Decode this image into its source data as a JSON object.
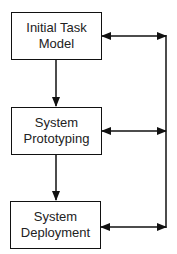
{
  "diagram": {
    "nodes": [
      {
        "id": "initial-task-model",
        "line1": "Initial Task",
        "line2": "Model"
      },
      {
        "id": "system-prototyping",
        "line1": "System",
        "line2": "Prototyping"
      },
      {
        "id": "system-deployment",
        "line1": "System",
        "line2": "Deployment"
      }
    ],
    "edges": [
      {
        "from": "initial-task-model",
        "to": "system-prototyping",
        "type": "directed"
      },
      {
        "from": "system-prototyping",
        "to": "system-deployment",
        "type": "directed"
      },
      {
        "from": "initial-task-model",
        "to": "feedback-bus",
        "type": "bidirectional"
      },
      {
        "from": "system-prototyping",
        "to": "feedback-bus",
        "type": "bidirectional"
      },
      {
        "from": "system-deployment",
        "to": "feedback-bus",
        "type": "bidirectional"
      }
    ],
    "colors": {
      "stroke": "#111111",
      "text": "#222222",
      "background": "#ffffff"
    }
  }
}
